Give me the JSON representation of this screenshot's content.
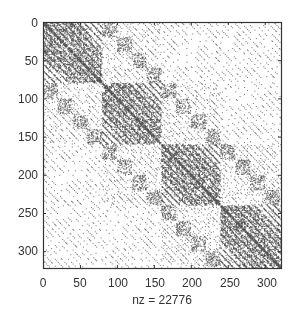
{
  "chart_data": {
    "type": "heatmap",
    "subtype": "spy (sparsity pattern)",
    "title": "",
    "xlabel": "nz = 22776",
    "ylabel": "",
    "nz": 22776,
    "matrix_size": [
      322,
      322
    ],
    "xlim": [
      0,
      322
    ],
    "ylim": [
      0,
      322
    ],
    "y_axis_reversed": true,
    "grid": false,
    "legend": null,
    "x_ticks": [
      0,
      50,
      100,
      150,
      200,
      250,
      300
    ],
    "x_tick_labels": [
      "0",
      "50",
      "100",
      "150",
      "200",
      "250",
      "300"
    ],
    "y_ticks": [
      0,
      50,
      100,
      150,
      200,
      250,
      300
    ],
    "y_tick_labels": [
      "0",
      "50",
      "100",
      "150",
      "200",
      "250",
      "300"
    ],
    "structure": {
      "diagonal_blocks": [
        [
          0,
          80
        ],
        [
          80,
          160
        ],
        [
          160,
          240
        ],
        [
          240,
          322
        ]
      ],
      "description": "Block-structured symmetric sparsity pattern: four dense diagonal blocks of ~80 with internal diagonal bands, off-diagonal blocks containing parallel dotted diagonals and small dense sub-blocks"
    },
    "marker_color": "#2a2a2a"
  },
  "axes": {
    "left_px": 43,
    "top_px": 22,
    "right_px": 281,
    "bottom_px": 268,
    "box_color": "#333333"
  }
}
